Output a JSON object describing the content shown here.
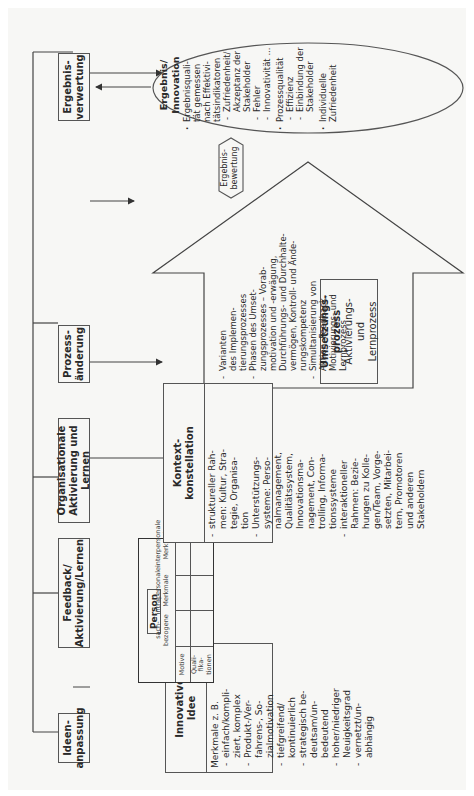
{
  "top_row": {
    "ideenanpassung": "Ideen-\nanpassung",
    "feedback": "Feedback/\nAktivierung/Lernen",
    "organisationale": "Organisationale\nAktivierung und Lernen",
    "prozessaenderung": "Prozess-\nänderung",
    "ergebnisverwertung": "Ergebnis-\nverwertung"
  },
  "innovative_idee": {
    "title": "Innovative\nIdee",
    "intro": "Merkmale z. B.",
    "items": [
      "einfach/kompli-\nziert, komplex",
      "Produkt-/Ver-\nfahrens-, So-\nzialmotivation",
      "tiefgreifend/\nkontinuierlich",
      "strategisch be-\ndeutsam/un-\nbedeutend",
      "hoher/niedriger\nNeuigkeitsgrad",
      "vernetzt/un-\nabhängig"
    ]
  },
  "person": {
    "title": "Person",
    "columns": [
      "sach-\nbezogene",
      "intrapersonale\nMerkmale",
      "interpersonale\nMerkmale"
    ],
    "rows": [
      "Motive",
      "Quali-\nfika-\ntionen"
    ]
  },
  "kontext": {
    "title": "Kontext-\nkonstellation",
    "items": [
      "struktureller Rah-\nmen: Kultur, Stra-\ntegie, Organisa-\ntion",
      "Unterstützungs-\nsysteme: Perso-\nnalmanagement,\nQualitätssystem,\nInnovationsma-\nnagement, Con-\ntrolling, Informa-\ntionssysteme",
      "interaktioneller\nRahmen: Bezie-\nhungen zu Kolle-\ngen/Team, Vorge-\nsetzten, Mitarbei-\ntern, Promotoren\nund anderen\nStakeholdern"
    ]
  },
  "umsetzung": {
    "title": "Umsetzungs-\nprozess",
    "subtitle": "Aktivierungs-\nund\nLernprozess",
    "items": [
      "Varianten\ndes Implemen-\ntierungsprozesses",
      "Phasen des Umset-\nzungsprozesses – Vorab-\nmotivation und -erwägung,\nDurchführungs- und Durchhalte-\nvermögen, Kontroll- und Ände-\nrungskompetenz",
      "Simultanisierung von\nAktion, Feedback,\nMotivierungs- und\nLernprozess"
    ]
  },
  "ergebnisbewertung": "Ergebnis-\nbewertung",
  "ergebnis": {
    "title": "Ergebnis/\nInnovation",
    "items": [
      {
        "text": "Ergebnisquali-\ntät gemessen\nnach Effektivi-\ntätsindikatoren",
        "level": 0
      },
      {
        "text": "Zufriedenheit/\nAkzeptanz der\nStakeholder",
        "level": 1
      },
      {
        "text": "Fehler",
        "level": 1
      },
      {
        "text": "Innovativität ...",
        "level": 1
      },
      {
        "text": "Prozessqualität",
        "level": 0
      },
      {
        "text": "Effizienz",
        "level": 1
      },
      {
        "text": "Einbindung der\nStakeholder",
        "level": 1
      },
      {
        "text": "Individuelle\nZufriedenheit",
        "level": 0
      }
    ]
  },
  "colors": {
    "line": "#444444",
    "page_bg": "#f7f7f5",
    "text": "#2a2a2a"
  }
}
